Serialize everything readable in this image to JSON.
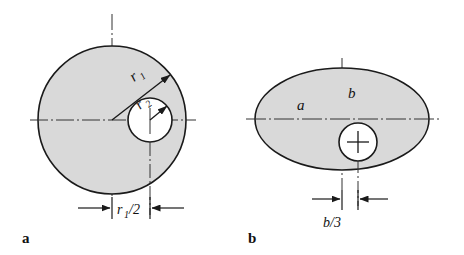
{
  "figure": {
    "background_color": "#ffffff",
    "fill_color": "#d9d9d9",
    "outline_color": "#1a1a1a",
    "centerline_color": "#333333",
    "panels": [
      {
        "key": "a",
        "caption": "a",
        "shape": "circle",
        "outer_label": "r",
        "outer_label_sub": "1",
        "inner_label": "r",
        "inner_label_sub": "2",
        "dimension_label_main": "r",
        "dimension_label_sub": "1",
        "dimension_label_tail": "/2",
        "dimension_text": "r1/2"
      },
      {
        "key": "b",
        "caption": "b",
        "shape": "ellipse",
        "semi_major_label": "a",
        "semi_minor_label": "b",
        "hole_marker": "cross",
        "dimension_text": "b/3"
      }
    ]
  },
  "geometry": {
    "panel_a": {
      "center_x": 112,
      "center_y": 120,
      "outer_radius": 74,
      "inner_circle_center_x": 150,
      "inner_circle_center_y": 120,
      "inner_radius": 22,
      "radius_leader_angle_deg": 52,
      "dimension_y": 208,
      "dimension_from_x": 112,
      "dimension_to_x": 150
    },
    "panel_b": {
      "center_x": 342,
      "center_y": 119,
      "semi_major_x": 87,
      "semi_minor_y": 51,
      "hole_center_x": 358,
      "hole_center_y": 142,
      "hole_radius": 19,
      "dimension_y": 199,
      "dimension_from_x": 342,
      "dimension_to_x": 358
    }
  }
}
